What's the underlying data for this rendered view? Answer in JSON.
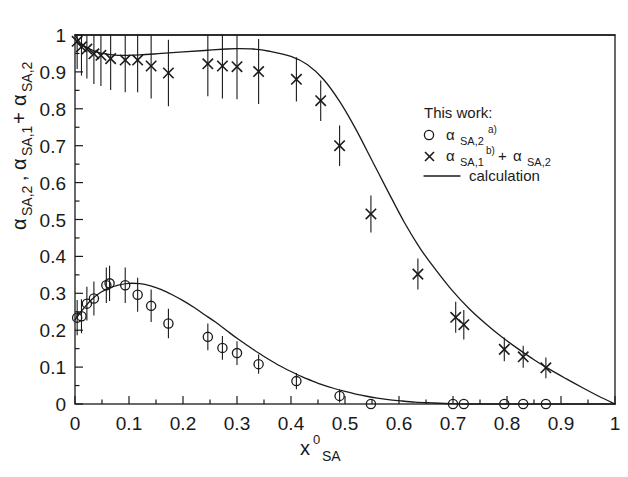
{
  "chart_data": {
    "type": "scatter",
    "title": "",
    "xlabel": "x0_SA",
    "xlabel_main": "x",
    "xlabel_sup": "0",
    "xlabel_sub": "SA",
    "ylabel": "alpha_SA,2, alpha_SA,1 + alpha_SA,2",
    "xlim": [
      0,
      1
    ],
    "ylim": [
      0,
      1
    ],
    "xticks": [
      0,
      0.1,
      0.2,
      0.3,
      0.4,
      0.5,
      0.6,
      0.7,
      0.8,
      0.9,
      1
    ],
    "xtick_labels": [
      "0",
      "0.1",
      "0.2",
      "0.3",
      "0.4",
      "0.5",
      "0.6",
      "0.7",
      "0.8",
      "0.9",
      "1"
    ],
    "yticks": [
      0,
      0.1,
      0.2,
      0.3,
      0.4,
      0.5,
      0.6,
      0.7,
      0.8,
      0.9,
      1
    ],
    "ytick_labels": [
      "0",
      "0.1",
      "0.2",
      "0.3",
      "0.4",
      "0.5",
      "0.6",
      "0.7",
      "0.8",
      "0.9",
      "1"
    ],
    "minor_ticks": true,
    "grid": false,
    "legend_position": "right-upper",
    "series": [
      {
        "name": "alpha_SA,1 + alpha_SA,2",
        "marker": "cross",
        "points": [
          {
            "x": 0.004,
            "y": 0.983,
            "yerr": 0.075
          },
          {
            "x": 0.012,
            "y": 0.968,
            "yerr": 0.078
          },
          {
            "x": 0.022,
            "y": 0.962,
            "yerr": 0.08
          },
          {
            "x": 0.035,
            "y": 0.949,
            "yerr": 0.082
          },
          {
            "x": 0.048,
            "y": 0.945,
            "yerr": 0.083
          },
          {
            "x": 0.066,
            "y": 0.936,
            "yerr": 0.085
          },
          {
            "x": 0.093,
            "y": 0.932,
            "yerr": 0.087
          },
          {
            "x": 0.116,
            "y": 0.932,
            "yerr": 0.087
          },
          {
            "x": 0.141,
            "y": 0.916,
            "yerr": 0.088
          },
          {
            "x": 0.173,
            "y": 0.897,
            "yerr": 0.09
          },
          {
            "x": 0.246,
            "y": 0.922,
            "yerr": 0.088
          },
          {
            "x": 0.273,
            "y": 0.916,
            "yerr": 0.088
          },
          {
            "x": 0.3,
            "y": 0.914,
            "yerr": 0.088
          },
          {
            "x": 0.34,
            "y": 0.901,
            "yerr": 0.088
          },
          {
            "x": 0.41,
            "y": 0.88,
            "yerr": 0.06
          },
          {
            "x": 0.455,
            "y": 0.822,
            "yerr": 0.055
          },
          {
            "x": 0.49,
            "y": 0.7,
            "yerr": 0.055
          },
          {
            "x": 0.548,
            "y": 0.515,
            "yerr": 0.05
          },
          {
            "x": 0.635,
            "y": 0.352,
            "yerr": 0.042
          },
          {
            "x": 0.705,
            "y": 0.235,
            "yerr": 0.042
          },
          {
            "x": 0.72,
            "y": 0.215,
            "yerr": 0.04
          },
          {
            "x": 0.795,
            "y": 0.148,
            "yerr": 0.032
          },
          {
            "x": 0.83,
            "y": 0.128,
            "yerr": 0.03
          },
          {
            "x": 0.872,
            "y": 0.098,
            "yerr": 0.028
          }
        ]
      },
      {
        "name": "alpha_SA,2",
        "marker": "circle",
        "points": [
          {
            "x": 0.004,
            "y": 0.234,
            "yerr": 0.048
          },
          {
            "x": 0.012,
            "y": 0.238,
            "yerr": 0.046
          },
          {
            "x": 0.022,
            "y": 0.272,
            "yerr": 0.046
          },
          {
            "x": 0.035,
            "y": 0.286,
            "yerr": 0.046
          },
          {
            "x": 0.058,
            "y": 0.322,
            "yerr": 0.048
          },
          {
            "x": 0.064,
            "y": 0.327,
            "yerr": 0.048
          },
          {
            "x": 0.093,
            "y": 0.322,
            "yerr": 0.048
          },
          {
            "x": 0.116,
            "y": 0.296,
            "yerr": 0.046
          },
          {
            "x": 0.141,
            "y": 0.266,
            "yerr": 0.044
          },
          {
            "x": 0.173,
            "y": 0.218,
            "yerr": 0.04
          },
          {
            "x": 0.246,
            "y": 0.182,
            "yerr": 0.036
          },
          {
            "x": 0.273,
            "y": 0.152,
            "yerr": 0.032
          },
          {
            "x": 0.3,
            "y": 0.138,
            "yerr": 0.032
          },
          {
            "x": 0.34,
            "y": 0.108,
            "yerr": 0.026
          },
          {
            "x": 0.41,
            "y": 0.062,
            "yerr": 0.022
          },
          {
            "x": 0.49,
            "y": 0.022,
            "yerr": 0.018
          },
          {
            "x": 0.548,
            "y": 0.0,
            "yerr": 0.0
          },
          {
            "x": 0.7,
            "y": 0.0,
            "yerr": 0.0
          },
          {
            "x": 0.72,
            "y": 0.0,
            "yerr": 0.0
          },
          {
            "x": 0.795,
            "y": 0.0,
            "yerr": 0.0
          },
          {
            "x": 0.83,
            "y": 0.0,
            "yerr": 0.0
          },
          {
            "x": 0.872,
            "y": 0.0,
            "yerr": 0.0
          }
        ]
      }
    ],
    "curves": [
      {
        "name": "calculation-upper",
        "points": [
          [
            0.0,
            1.0
          ],
          [
            0.01,
            0.978
          ],
          [
            0.02,
            0.968
          ],
          [
            0.035,
            0.957
          ],
          [
            0.05,
            0.95
          ],
          [
            0.08,
            0.945
          ],
          [
            0.12,
            0.946
          ],
          [
            0.16,
            0.95
          ],
          [
            0.2,
            0.954
          ],
          [
            0.24,
            0.958
          ],
          [
            0.28,
            0.962
          ],
          [
            0.3,
            0.963
          ],
          [
            0.33,
            0.962
          ],
          [
            0.36,
            0.956
          ],
          [
            0.4,
            0.942
          ],
          [
            0.43,
            0.92
          ],
          [
            0.46,
            0.88
          ],
          [
            0.49,
            0.82
          ],
          [
            0.52,
            0.745
          ],
          [
            0.55,
            0.66
          ],
          [
            0.58,
            0.575
          ],
          [
            0.61,
            0.492
          ],
          [
            0.64,
            0.42
          ],
          [
            0.67,
            0.36
          ],
          [
            0.7,
            0.305
          ],
          [
            0.73,
            0.258
          ],
          [
            0.76,
            0.218
          ],
          [
            0.79,
            0.182
          ],
          [
            0.82,
            0.15
          ],
          [
            0.85,
            0.12
          ],
          [
            0.88,
            0.093
          ],
          [
            0.91,
            0.068
          ],
          [
            0.94,
            0.044
          ],
          [
            0.97,
            0.021
          ],
          [
            1.0,
            0.0
          ]
        ]
      },
      {
        "name": "calculation-lower",
        "points": [
          [
            0.0,
            0.228
          ],
          [
            0.01,
            0.248
          ],
          [
            0.02,
            0.266
          ],
          [
            0.03,
            0.282
          ],
          [
            0.045,
            0.3
          ],
          [
            0.06,
            0.312
          ],
          [
            0.08,
            0.322
          ],
          [
            0.1,
            0.327
          ],
          [
            0.12,
            0.326
          ],
          [
            0.14,
            0.32
          ],
          [
            0.16,
            0.31
          ],
          [
            0.18,
            0.296
          ],
          [
            0.2,
            0.28
          ],
          [
            0.22,
            0.262
          ],
          [
            0.24,
            0.242
          ],
          [
            0.26,
            0.222
          ],
          [
            0.28,
            0.2
          ],
          [
            0.3,
            0.178
          ],
          [
            0.32,
            0.158
          ],
          [
            0.34,
            0.138
          ],
          [
            0.36,
            0.12
          ],
          [
            0.38,
            0.103
          ],
          [
            0.4,
            0.088
          ],
          [
            0.42,
            0.074
          ],
          [
            0.44,
            0.062
          ],
          [
            0.46,
            0.051
          ],
          [
            0.48,
            0.042
          ],
          [
            0.5,
            0.034
          ],
          [
            0.52,
            0.027
          ],
          [
            0.54,
            0.021
          ],
          [
            0.56,
            0.016
          ],
          [
            0.58,
            0.012
          ],
          [
            0.6,
            0.009
          ],
          [
            0.63,
            0.005
          ],
          [
            0.66,
            0.003
          ],
          [
            0.7,
            0.001
          ],
          [
            0.75,
            0.0
          ],
          [
            1.0,
            0.0
          ]
        ]
      },
      {
        "name": "top-border-line",
        "points": [
          [
            0.0,
            1.0
          ],
          [
            1.0,
            1.0
          ]
        ]
      }
    ]
  },
  "legend": {
    "title": "This work:",
    "entries": [
      {
        "symbol": "circle",
        "base": "α",
        "sub": "SA,2",
        "sup": "a)",
        "tail": ""
      },
      {
        "symbol": "cross",
        "base": "α",
        "sub": "SA,1",
        "sup": "b)",
        "tail_plus": " + ",
        "tail_base": "α",
        "tail_sub": "SA,2"
      },
      {
        "symbol": "line",
        "label": "calculation"
      }
    ]
  },
  "axes": {
    "y_title_parts": {
      "a_base": "α",
      "a_sub": "SA,2",
      "comma": ", ",
      "b_base": "α",
      "b_sub": "SA,1",
      "plus": " + ",
      "c_base": "α",
      "c_sub": "SA,2"
    },
    "x_title_parts": {
      "base": "x",
      "sup": "0",
      "sub": "SA"
    }
  }
}
